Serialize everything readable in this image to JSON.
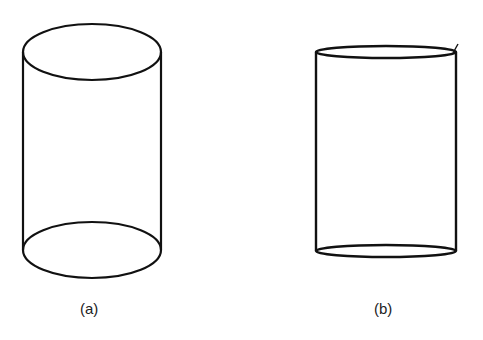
{
  "figure": {
    "stroke_color": "#111111",
    "background": "#ffffff",
    "panels": [
      {
        "id": "a",
        "label": "(a)",
        "shape": "cylinder-perspective"
      },
      {
        "id": "b",
        "label": "(b)",
        "shape": "cylinder-flat"
      }
    ]
  }
}
